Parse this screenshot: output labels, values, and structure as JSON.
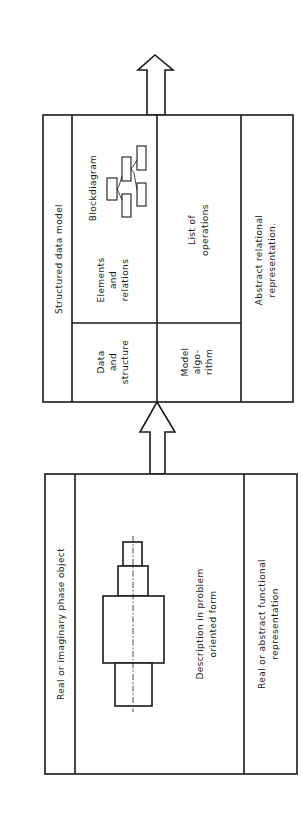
{
  "diagram": {
    "upper_box": {
      "title": "Structured data model",
      "cells": {
        "data_structure": [
          "Data",
          "and",
          "structure"
        ],
        "elements_relations": [
          "Elements",
          "and",
          "relations"
        ],
        "blockdiagram_label": "Blockdiagram",
        "model_algorithm": [
          "Model",
          "algo-",
          "rithm"
        ],
        "list_of_operations": [
          "List of",
          "operations"
        ]
      },
      "footer": [
        "Abstract relational",
        "representation."
      ]
    },
    "lower_box": {
      "title": "Real or imaginary phase object",
      "description": [
        "Description in problem",
        "oriented form"
      ],
      "footer": [
        "Real or abstract functional",
        "representation"
      ]
    },
    "icons": {
      "top_arrow": "hollow-arrow-up",
      "middle_arrow": "hollow-arrow-up",
      "blockdiagram": "block-diagram-icon",
      "shaft_part": "stepped-shaft-drawing"
    },
    "colors": {
      "line": "#1a1a1a",
      "background": "#ffffff"
    }
  }
}
